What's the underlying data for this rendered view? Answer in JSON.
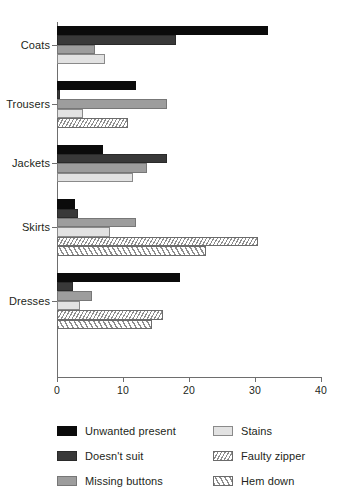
{
  "chart_data": {
    "type": "bar",
    "orientation": "horizontal",
    "title": "",
    "subtitle": "",
    "xlabel": "",
    "ylabel": "",
    "xlim": [
      0,
      40
    ],
    "xticks": [
      0,
      10,
      20,
      30,
      40
    ],
    "xtick_labels": [
      "0",
      "10",
      "20",
      "30",
      "40"
    ],
    "grid": false,
    "legend_position": "bottom",
    "categories": [
      "Coats",
      "Trousers",
      "Jackets",
      "Skirts",
      "Dresses"
    ],
    "series": [
      {
        "name": "Unwanted present",
        "color": "#0b0b0b",
        "fill": "solid",
        "values": [
          32,
          12,
          7,
          2.7,
          18.7
        ]
      },
      {
        "name": "Doesn't suit",
        "color": "#393939",
        "fill": "solid",
        "values": [
          18,
          0.5,
          16.6,
          3.2,
          2.4
        ]
      },
      {
        "name": "Missing buttons",
        "color": "#9d9d9d",
        "fill": "solid",
        "values": [
          5.8,
          16.7,
          13.6,
          11.9,
          5.3
        ]
      },
      {
        "name": "Stains",
        "color": "#e2e2e2",
        "fill": "solid",
        "values": [
          7.3,
          4,
          11.5,
          8,
          3.5
        ]
      },
      {
        "name": "Faulty zipper",
        "color": "#8d8d8d",
        "fill": "hatch-forward",
        "values": [
          null,
          10.8,
          null,
          30.5,
          16.1
        ]
      },
      {
        "name": "Hem down",
        "color": "#8d8d8d",
        "fill": "hatch-back",
        "values": [
          null,
          null,
          null,
          22.5,
          14.4
        ]
      }
    ]
  },
  "legend": {
    "left_items": [
      {
        "label": "Unwanted present",
        "swatch": "s0"
      },
      {
        "label": "Doesn't suit",
        "swatch": "s1"
      },
      {
        "label": "Missing buttons",
        "swatch": "s2"
      }
    ],
    "right_items": [
      {
        "label": "Stains",
        "swatch": "s3"
      },
      {
        "label": "Faulty zipper",
        "swatch": "s4"
      },
      {
        "label": "Hem down",
        "swatch": "s5"
      }
    ]
  }
}
